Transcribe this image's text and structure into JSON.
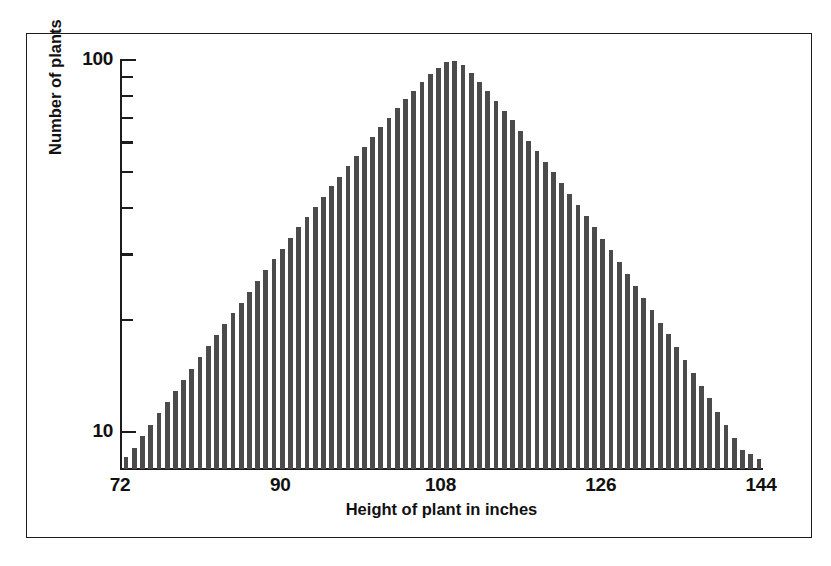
{
  "chart_data": {
    "type": "bar",
    "title": "",
    "subtitle": "",
    "xlabel": "Height of plant in inches",
    "ylabel": "Number of plants",
    "yscale": "log",
    "xlim": [
      72,
      144
    ],
    "ylim": [
      8,
      100
    ],
    "grid": false,
    "legend": null,
    "bar_color": "#4b4b4b",
    "axis_color": "#1c1c1c",
    "background": "#ffffff",
    "x_ticks": [
      {
        "value": 72,
        "label": "72"
      },
      {
        "value": 90,
        "label": "90"
      },
      {
        "value": 108,
        "label": "108"
      },
      {
        "value": 126,
        "label": "126"
      },
      {
        "value": 144,
        "label": "144"
      }
    ],
    "y_ticks_major": [
      {
        "value": 10,
        "label": "10"
      },
      {
        "value": 100,
        "label": "100"
      }
    ],
    "y_ticks_minor": [
      20,
      30,
      40,
      50,
      60,
      70,
      80,
      90
    ],
    "note": "Log-scale histogram; bar tops form a near-symmetric triangle, i.e. a log-normal distribution of plant heights peaking near 106 inches at about 100 plants.",
    "categories": [
      72,
      72.9,
      73.8,
      74.8,
      75.7,
      76.6,
      77.5,
      78.5,
      79.4,
      80.3,
      81.2,
      82.2,
      83.1,
      84,
      84.9,
      85.9,
      86.8,
      87.7,
      88.6,
      89.6,
      90.5,
      91.4,
      92.3,
      93.3,
      94.2,
      95.1,
      96,
      97,
      97.9,
      98.8,
      99.7,
      100.7,
      101.6,
      102.5,
      103.4,
      104.4,
      105.3,
      106.2,
      107.1,
      108.1,
      109,
      109.9,
      110.8,
      111.8,
      112.7,
      113.6,
      114.5,
      115.5,
      116.4,
      117.3,
      118.2,
      119.2,
      120.1,
      121,
      121.9,
      122.9,
      123.8,
      124.7,
      125.6,
      126.6,
      127.5,
      128.4,
      129.3,
      130.3,
      131.2,
      132.1,
      133,
      134,
      134.9,
      135.8,
      136.7,
      137.7,
      138.6,
      139.5,
      140.4,
      141.4,
      142.3,
      143.2
    ],
    "values": [
      8.6,
      9.1,
      9.8,
      10.5,
      11.3,
      12.1,
      13.0,
      13.9,
      14.9,
      16.0,
      17.1,
      18.3,
      19.6,
      21.0,
      22.4,
      24.0,
      25.6,
      27.4,
      29.3,
      31.3,
      33.4,
      35.7,
      38.0,
      40.5,
      43.2,
      46.0,
      48.9,
      52.1,
      55.4,
      58.9,
      62.5,
      66.4,
      70.4,
      74.6,
      78.9,
      83.3,
      87.7,
      92.0,
      96.0,
      99.2,
      100.0,
      97.5,
      93.0,
      88.0,
      83.0,
      78.2,
      73.6,
      69.2,
      65.0,
      61.0,
      57.2,
      53.6,
      50.2,
      47.0,
      43.9,
      41.0,
      38.3,
      35.7,
      33.3,
      31.0,
      28.8,
      26.8,
      24.9,
      23.1,
      21.4,
      19.8,
      18.4,
      17.0,
      15.7,
      14.5,
      13.4,
      12.4,
      11.4,
      10.5,
      9.7,
      9.0,
      8.8,
      8.5
    ]
  }
}
